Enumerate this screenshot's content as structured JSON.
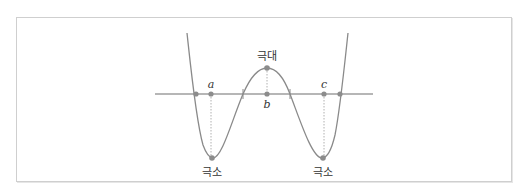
{
  "diagram": {
    "type": "quartic-function-extrema",
    "labels": {
      "maximum": "극대",
      "minimum_left": "극소",
      "minimum_right": "극소",
      "point_a": "a",
      "point_b": "b",
      "point_c": "c"
    },
    "colors": {
      "curve": "#8a8a8a",
      "axis": "#6e6e6e",
      "point": "#8c8c8c",
      "guide": "#b0b0b0",
      "frame": "#cfcfcf"
    }
  }
}
